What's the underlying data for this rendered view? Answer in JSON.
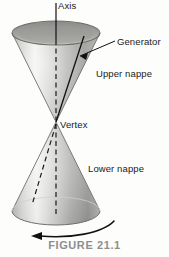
{
  "figure": {
    "caption": "FIGURE 21.1",
    "caption_color": "#8e8e8e",
    "background_color": "#fdfdfc",
    "width": 169,
    "height": 257
  },
  "labels": {
    "axis": "Axis",
    "generator": "Generator",
    "upper_nappe": "Upper nappe",
    "vertex": "Vertex",
    "lower_nappe": "Lower nappe"
  },
  "diagram": {
    "line_color": "#111111",
    "cone_light": "#e9e9e7",
    "cone_mid": "#b4b4b2",
    "cone_dark": "#8a8a88",
    "cone_edge": "#6f6f6d",
    "parts": [
      {
        "name": "axis-line",
        "style": "solid-vertical"
      },
      {
        "name": "axis-dashed-segment",
        "style": "dashed-vertical"
      },
      {
        "name": "generator-line",
        "style": "solid-slant"
      },
      {
        "name": "hidden-generator-line",
        "style": "dashed-slant"
      },
      {
        "name": "upper-nappe-surface",
        "style": "shaded-cone-inverted"
      },
      {
        "name": "lower-nappe-surface",
        "style": "shaded-cone"
      },
      {
        "name": "top-rim-ellipse",
        "style": "ellipse"
      },
      {
        "name": "base-rim-ellipse",
        "style": "ellipse"
      },
      {
        "name": "rotation-arrow",
        "style": "curved-arrow-left"
      },
      {
        "name": "generator-pointer-arrow",
        "style": "straight-arrow"
      }
    ],
    "geometry": {
      "vertex_x": 56,
      "vertex_y": 122,
      "top_ellipse_cx": 56,
      "top_ellipse_cy": 33,
      "top_ellipse_rx": 44,
      "top_ellipse_ry": 12,
      "base_ellipse_cx": 56,
      "base_ellipse_cy": 211,
      "base_ellipse_rx": 44,
      "base_ellipse_ry": 14
    }
  }
}
